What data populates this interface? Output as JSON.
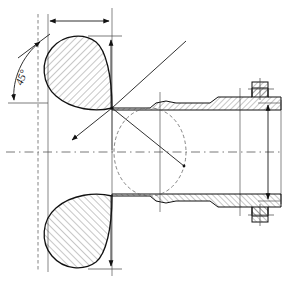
{
  "drawing": {
    "title": "Pipe Nozzle Cross-Section with Angled Reinforcement",
    "type": "engineering-cross-section",
    "width": 286,
    "height": 282,
    "background_color": "#ffffff",
    "line_color": "#1a1a1a",
    "hatch_color": "#333333",
    "centerline_color": "#555555",
    "annotations": {
      "angle_label": "45°",
      "angle_value": 45,
      "angle_unit": "degrees"
    },
    "centerline": {
      "name": "horizontal-axis",
      "y": 152,
      "x_start": 6,
      "x_end": 280,
      "style": "dash-dot"
    },
    "dimensions": [
      {
        "name": "top-width-dimension",
        "orientation": "horizontal",
        "y": 21,
        "x_start": 48,
        "x_end": 111,
        "label": "",
        "arrows": "both"
      },
      {
        "name": "right-height-dimension",
        "orientation": "vertical",
        "x": 268,
        "y_start": 103,
        "y_end": 200,
        "label": "",
        "arrows": "both"
      },
      {
        "name": "teardrop-top-leader",
        "orientation": "vertical",
        "x": 111,
        "y_start": 35,
        "y_end": 108,
        "label": "",
        "arrows": "top"
      },
      {
        "name": "teardrop-bottom-leader",
        "orientation": "vertical",
        "x": 111,
        "y_start": 196,
        "y_end": 268,
        "label": "",
        "arrows": "bottom"
      }
    ],
    "construction_lines": [
      {
        "name": "diagonal-upper-right",
        "x1": 112,
        "y1": 108,
        "x2": 186,
        "y2": 41
      },
      {
        "name": "diagonal-lower-left",
        "x1": 112,
        "y1": 108,
        "x2": 67,
        "y2": 144
      },
      {
        "name": "diagonal-lower-right",
        "x1": 112,
        "y1": 108,
        "x2": 184,
        "y2": 166
      },
      {
        "name": "vertical-through-node",
        "x": 112,
        "y_start": 8,
        "y_end": 276
      }
    ],
    "hidden_detail": {
      "name": "dashed-bore-ellipse",
      "cx": 150,
      "cy": 152,
      "rx": 36,
      "ry": 44
    },
    "components": [
      {
        "name": "teardrop-upper",
        "description": "hatched airfoil reinforcement pad, upper half"
      },
      {
        "name": "teardrop-lower",
        "description": "hatched airfoil reinforcement pad, lower half"
      },
      {
        "name": "pipe-wall-upper",
        "description": "hatched pipe wall, upper"
      },
      {
        "name": "pipe-wall-lower",
        "description": "hatched pipe wall, lower"
      },
      {
        "name": "flange-upper",
        "description": "raised hatched flange block, right end upper"
      },
      {
        "name": "flange-lower",
        "description": "raised hatched flange block, right end lower"
      }
    ]
  }
}
